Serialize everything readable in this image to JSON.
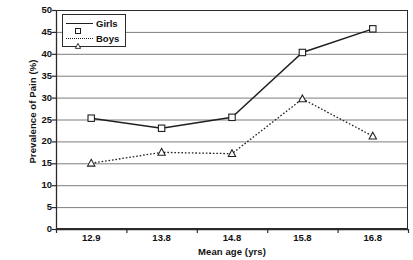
{
  "chart_data": {
    "type": "line",
    "title": "",
    "xlabel": "Mean age (yrs)",
    "ylabel": "Prevalence of Pain (%)",
    "categories": [
      "12.9",
      "13.8",
      "14.8",
      "15.8",
      "16.8"
    ],
    "x_tick_labels": [
      "12.9",
      "13.8",
      "14.8",
      "15.8",
      "16.8"
    ],
    "y_tick_labels": [
      "0",
      "5",
      "10",
      "15",
      "20",
      "25",
      "30",
      "35",
      "40",
      "45",
      "50"
    ],
    "ylim": [
      0,
      50
    ],
    "y_step": 5,
    "grid": "horizontal",
    "legend_position": "upper-left-inside",
    "series": [
      {
        "name": "Girls",
        "marker": "open-square",
        "linestyle": "solid",
        "color": "#1f1f1f",
        "values": [
          25.3,
          23.0,
          25.5,
          40.3,
          45.7
        ]
      },
      {
        "name": "Boys",
        "marker": "open-triangle",
        "linestyle": "dotted",
        "color": "#1f1f1f",
        "values": [
          15.0,
          17.5,
          17.2,
          29.7,
          21.2
        ]
      }
    ]
  },
  "legend": {
    "entries": [
      {
        "label": "Girls"
      },
      {
        "label": "Boys"
      }
    ]
  },
  "colors": {
    "axis": "#2b2b2b",
    "grid": "#7d7d7d",
    "series": "#1f1f1f",
    "background": "#ffffff"
  }
}
